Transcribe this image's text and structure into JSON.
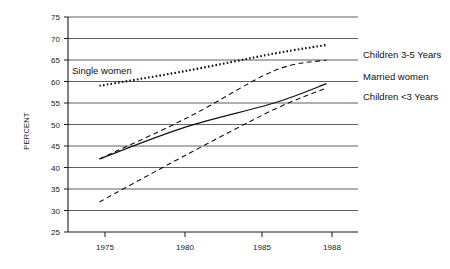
{
  "chart_data": {
    "type": "line",
    "title": "",
    "xlabel": "",
    "ylabel": "PERCENT",
    "x": [
      1975,
      1980,
      1985,
      1988
    ],
    "xlim": [
      1973.2,
      1989.8
    ],
    "ylim": [
      25,
      75
    ],
    "yticks": [
      25,
      30,
      35,
      40,
      45,
      50,
      55,
      60,
      65,
      70,
      75
    ],
    "xticks": [
      1975,
      1980,
      1985,
      1988
    ],
    "xtick_labels": [
      "1975",
      "1980",
      "1985",
      "1988"
    ],
    "ytick_labels": [
      "25",
      "30",
      "35",
      "40",
      "45",
      "50",
      "55",
      "60",
      "65",
      "70",
      "75"
    ],
    "grid": true,
    "grid_axis": "y",
    "legend_position": "inline-right-and-inplot",
    "series": [
      {
        "name": "Single women",
        "style": "dotted",
        "label_position": "in-plot-upper-left",
        "values": [
          59.0,
          62.5,
          66.5,
          68.5
        ]
      },
      {
        "name": "Children 3-5 Years",
        "style": "dashed",
        "label_position": "right",
        "values": [
          42.0,
          51.5,
          62.5,
          65.0
        ]
      },
      {
        "name": "Married women",
        "style": "solid",
        "label_position": "right",
        "values": [
          42.0,
          49.5,
          55.0,
          59.5
        ]
      },
      {
        "name": "Children <3 Years",
        "style": "dashed",
        "label_position": "right",
        "values": [
          32.0,
          43.0,
          53.5,
          58.5
        ]
      }
    ]
  },
  "labels": {
    "ylabel": "PERCENT",
    "single_women": "Single women",
    "children_3_5": "Children 3-5 Years",
    "married_women": "Married women",
    "children_under_3": "Children <3 Years"
  },
  "yticks": {
    "t25": "25",
    "t30": "30",
    "t35": "35",
    "t40": "40",
    "t45": "45",
    "t50": "50",
    "t55": "55",
    "t60": "60",
    "t65": "65",
    "t70": "70",
    "t75": "75"
  },
  "xticks": {
    "t1975": "1975",
    "t1980": "1980",
    "t1985": "1985",
    "t1988": "1988"
  },
  "colors": {
    "ink": "#111111",
    "grid": "#4d4d4d",
    "background": "#ffffff"
  }
}
